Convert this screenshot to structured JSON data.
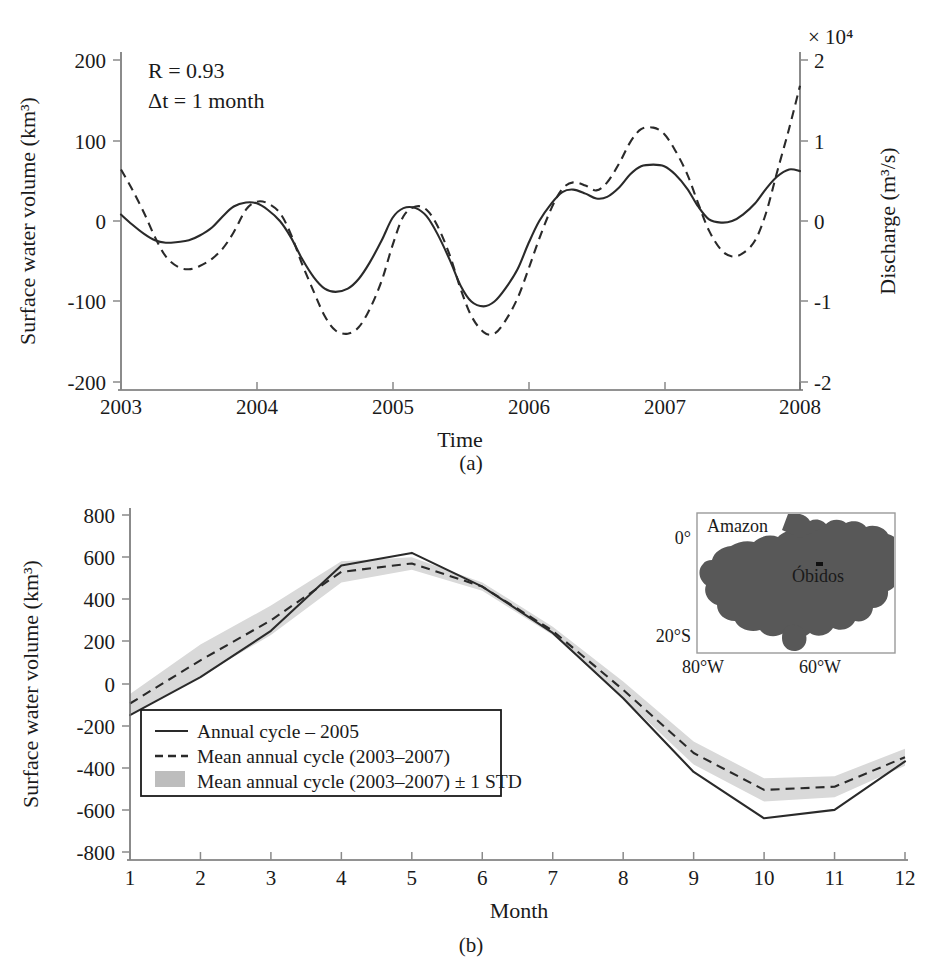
{
  "figure": {
    "panels": [
      {
        "letter": "(a)",
        "annotations": [
          "R = 0.93",
          "Δt = 1 month"
        ],
        "left_axis_label": "Surface water volume (km³)",
        "right_axis_label": "Discharge (m³/s)",
        "right_axis_exponent": "× 10⁴",
        "xlabel": "Time"
      },
      {
        "letter": "(b)",
        "ylabel": "Surface water volume (km³)",
        "xlabel": "Month",
        "legend": [
          {
            "style": "solid",
            "label": "Annual cycle – 2005"
          },
          {
            "style": "dashed",
            "label": "Mean annual cycle (2003–2007)"
          },
          {
            "style": "band",
            "label": "Mean annual cycle (2003–2007) ± 1 STD"
          }
        ],
        "inset": {
          "title": "Amazon",
          "station": "Óbidos",
          "lat_labels": [
            "0°",
            "20°S"
          ],
          "lon_labels": [
            "80°W",
            "60°W"
          ],
          "basin_color": "#585858"
        }
      }
    ],
    "colors": {
      "line": "#2a2a2a",
      "axis": "#6e6e6e",
      "std_band": "#d9d9d9",
      "background": "#ffffff"
    }
  },
  "chart_data": [
    {
      "type": "line",
      "panel": "(a)",
      "title": "",
      "xlabel": "Time",
      "ylabel": "Surface water volume (km³)",
      "y2label": "Discharge (m³/s)",
      "y2_exponent": "× 10⁴",
      "xlim": [
        2003,
        2008
      ],
      "ylim": [
        -200,
        200
      ],
      "y2lim": [
        -20000,
        20000
      ],
      "xticks": [
        2003,
        2004,
        2005,
        2006,
        2007,
        2008
      ],
      "xticklabels": [
        "2003",
        "2004",
        "2005",
        "2006",
        "2007",
        "2008"
      ],
      "yticks": [
        -200,
        -100,
        0,
        100,
        200
      ],
      "yticklabels": [
        "-200",
        "-100",
        "0",
        "100",
        "200"
      ],
      "y2ticks": [
        -2,
        -1,
        0,
        1,
        2
      ],
      "y2ticklabels": [
        "-2",
        "-1",
        "0",
        "1",
        "2"
      ],
      "grid": false,
      "legend": "none",
      "annotations": [
        "R = 0.93",
        "Δt = 1 month"
      ],
      "series": [
        {
          "name": "Surface water volume",
          "style": "solid",
          "axis": "left",
          "x": [
            2003.0,
            2003.08,
            2003.17,
            2003.25,
            2003.33,
            2003.42,
            2003.5,
            2003.58,
            2003.67,
            2003.75,
            2003.83,
            2003.92,
            2004.0,
            2004.08,
            2004.17,
            2004.25,
            2004.33,
            2004.42,
            2004.5,
            2004.58,
            2004.67,
            2004.75,
            2004.83,
            2004.92,
            2005.0,
            2005.08,
            2005.17,
            2005.25,
            2005.33,
            2005.42,
            2005.5,
            2005.58,
            2005.67,
            2005.75,
            2005.83,
            2005.92,
            2006.0,
            2006.08,
            2006.17,
            2006.25,
            2006.33,
            2006.42,
            2006.5,
            2006.58,
            2006.67,
            2006.75,
            2006.83,
            2006.92,
            2007.0,
            2007.08,
            2007.17,
            2007.25,
            2007.33,
            2007.42,
            2007.5,
            2007.58,
            2007.67,
            2007.75,
            2007.83,
            2007.92,
            2008.0
          ],
          "y": [
            8,
            -4,
            -16,
            -24,
            -27,
            -26,
            -24,
            -18,
            -8,
            6,
            18,
            23,
            22,
            14,
            0,
            -20,
            -46,
            -70,
            -84,
            -88,
            -84,
            -72,
            -52,
            -24,
            4,
            16,
            16,
            6,
            -16,
            -48,
            -80,
            -100,
            -106,
            -100,
            -84,
            -60,
            -28,
            0,
            22,
            36,
            39,
            34,
            28,
            30,
            42,
            58,
            68,
            70,
            68,
            58,
            40,
            18,
            2,
            -2,
            0,
            8,
            22,
            40,
            55,
            64,
            62
          ]
        },
        {
          "name": "Discharge",
          "style": "dashed",
          "axis": "right",
          "x": [
            2003.0,
            2003.08,
            2003.17,
            2003.25,
            2003.33,
            2003.42,
            2003.5,
            2003.58,
            2003.67,
            2003.75,
            2003.83,
            2003.92,
            2004.0,
            2004.08,
            2004.17,
            2004.25,
            2004.33,
            2004.42,
            2004.5,
            2004.58,
            2004.67,
            2004.75,
            2004.83,
            2004.92,
            2005.0,
            2005.08,
            2005.17,
            2005.25,
            2005.33,
            2005.42,
            2005.5,
            2005.58,
            2005.67,
            2005.75,
            2005.83,
            2005.92,
            2006.0,
            2006.08,
            2006.17,
            2006.25,
            2006.33,
            2006.42,
            2006.5,
            2006.58,
            2006.67,
            2006.75,
            2006.83,
            2006.92,
            2007.0,
            2007.08,
            2007.17,
            2007.25,
            2007.33,
            2007.42,
            2007.5,
            2007.58,
            2007.67,
            2007.75,
            2007.83,
            2007.92,
            2008.0
          ],
          "y_km3_equivalent": [
            64,
            40,
            10,
            -20,
            -44,
            -57,
            -60,
            -56,
            -47,
            -34,
            -14,
            14,
            24,
            22,
            10,
            -16,
            -52,
            -88,
            -118,
            -136,
            -140,
            -132,
            -110,
            -74,
            -30,
            6,
            18,
            14,
            -6,
            -42,
            -84,
            -118,
            -138,
            -140,
            -124,
            -96,
            -60,
            -22,
            16,
            40,
            48,
            44,
            38,
            48,
            72,
            98,
            114,
            116,
            108,
            88,
            58,
            22,
            -12,
            -36,
            -44,
            -40,
            -24,
            10,
            60,
            115,
            168
          ]
        }
      ]
    },
    {
      "type": "line",
      "panel": "(b)",
      "title": "",
      "xlabel": "Month",
      "ylabel": "Surface water volume (km³)",
      "xlim": [
        1,
        12
      ],
      "ylim": [
        -800,
        800
      ],
      "xticks": [
        1,
        2,
        3,
        4,
        5,
        6,
        7,
        8,
        9,
        10,
        11,
        12
      ],
      "xticklabels": [
        "1",
        "2",
        "3",
        "4",
        "5",
        "6",
        "7",
        "8",
        "9",
        "10",
        "11",
        "12"
      ],
      "yticks": [
        -800,
        -600,
        -400,
        -200,
        0,
        200,
        400,
        600,
        800
      ],
      "yticklabels": [
        "-800",
        "-600",
        "-400",
        "-200",
        "0",
        "200",
        "400",
        "600",
        "800"
      ],
      "grid": false,
      "legend_position": "lower-left",
      "categories": [
        1,
        2,
        3,
        4,
        5,
        6,
        7,
        8,
        9,
        10,
        11,
        12
      ],
      "series": [
        {
          "name": "Annual cycle – 2005",
          "style": "solid",
          "values": [
            -150,
            30,
            250,
            560,
            620,
            460,
            240,
            -70,
            -420,
            -640,
            -600,
            -370
          ]
        },
        {
          "name": "Mean annual cycle (2003–2007)",
          "style": "dashed",
          "values": [
            -95,
            110,
            300,
            530,
            570,
            460,
            250,
            -30,
            -330,
            -505,
            -490,
            -350
          ]
        },
        {
          "name": "Mean annual cycle (2003–2007) + 1 STD",
          "style": "band-upper",
          "values": [
            -50,
            185,
            370,
            580,
            600,
            480,
            270,
            10,
            -275,
            -450,
            -440,
            -310
          ]
        },
        {
          "name": "Mean annual cycle (2003–2007) - 1 STD",
          "style": "band-lower",
          "values": [
            -145,
            35,
            230,
            480,
            540,
            440,
            230,
            -70,
            -385,
            -560,
            -540,
            -390
          ]
        }
      ]
    }
  ]
}
